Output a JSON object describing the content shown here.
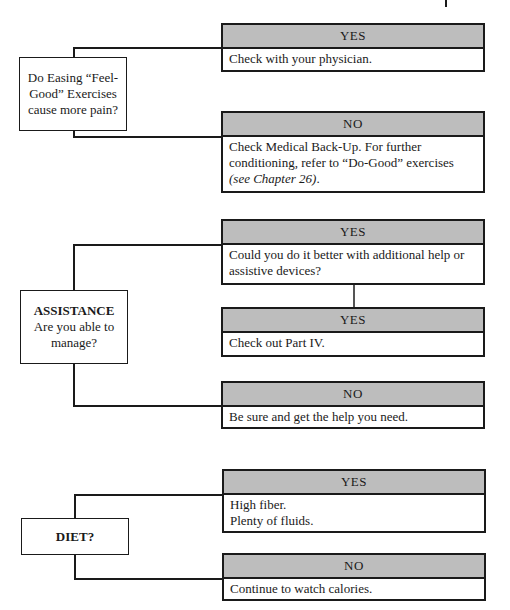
{
  "flowcharts": [
    {
      "question": {
        "title": "",
        "text": "Do Easing “Feel-Good” Exercises cause more pain?"
      },
      "branches": [
        {
          "label": "YES",
          "text": "Check with your physician."
        },
        {
          "label": "NO",
          "text": "Check Medical Back-Up. For further conditioning, refer to “Do-Good” exercises",
          "italic_text": "(see Chapter 26)",
          "trailing": "."
        }
      ]
    },
    {
      "question": {
        "title": "ASSISTANCE",
        "text": "Are you able to manage?"
      },
      "branches": [
        {
          "label": "YES",
          "text": "Could you do it better with additional help or assistive devices?"
        },
        {
          "label": "YES",
          "text": "Check out Part IV."
        },
        {
          "label": "NO",
          "text": "Be sure and get the help you need."
        }
      ]
    },
    {
      "question": {
        "title": "DIET?",
        "text": ""
      },
      "branches": [
        {
          "label": "YES",
          "lines": [
            "High fiber.",
            "Plenty of fluids."
          ]
        },
        {
          "label": "NO",
          "text": "Continue to watch calories."
        }
      ]
    }
  ],
  "colors": {
    "header_fill": "#bdbdbd",
    "stroke": "#1a1a1a"
  }
}
